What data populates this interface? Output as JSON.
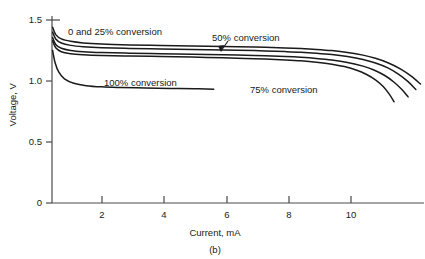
{
  "chart_data": {
    "type": "line",
    "title": "",
    "caption": "(b)",
    "xlabel": "Current, mA",
    "ylabel": "Voltage, V",
    "xlim": [
      0,
      12
    ],
    "ylim": [
      0,
      1.5
    ],
    "xticks": [
      2,
      4,
      6,
      8,
      10
    ],
    "yticks": [
      0,
      0.5,
      1.0,
      1.5
    ],
    "xtick_labels": [
      "2",
      "4",
      "6",
      "8",
      "10"
    ],
    "ytick_labels": [
      "0",
      "0.5",
      "1.0",
      "1.5"
    ],
    "grid": false,
    "legend_position": "inline-annotations",
    "series": [
      {
        "name": "0% conversion",
        "label": "0 and 25% conversion",
        "points": [
          [
            0.02,
            1.44
          ],
          [
            0.12,
            1.38
          ],
          [
            0.3,
            1.345
          ],
          [
            0.6,
            1.325
          ],
          [
            1.0,
            1.312
          ],
          [
            1.6,
            1.303
          ],
          [
            2.5,
            1.296
          ],
          [
            3.5,
            1.291
          ],
          [
            4.5,
            1.287
          ],
          [
            5.5,
            1.283
          ],
          [
            6.5,
            1.278
          ],
          [
            7.5,
            1.271
          ],
          [
            8.0,
            1.266
          ],
          [
            8.5,
            1.259
          ],
          [
            9.0,
            1.249
          ],
          [
            9.5,
            1.234
          ],
          [
            10.0,
            1.212
          ],
          [
            10.4,
            1.186
          ],
          [
            10.8,
            1.15
          ],
          [
            11.2,
            1.1
          ],
          [
            11.55,
            1.04
          ],
          [
            11.85,
            0.975
          ]
        ]
      },
      {
        "name": "25% conversion",
        "label": "",
        "points": [
          [
            0.02,
            1.4
          ],
          [
            0.12,
            1.345
          ],
          [
            0.3,
            1.312
          ],
          [
            0.6,
            1.292
          ],
          [
            1.0,
            1.281
          ],
          [
            1.6,
            1.273
          ],
          [
            2.5,
            1.267
          ],
          [
            3.5,
            1.262
          ],
          [
            4.5,
            1.258
          ],
          [
            5.5,
            1.254
          ],
          [
            6.5,
            1.249
          ],
          [
            7.5,
            1.241
          ],
          [
            8.0,
            1.236
          ],
          [
            8.5,
            1.228
          ],
          [
            9.0,
            1.217
          ],
          [
            9.5,
            1.2
          ],
          [
            10.0,
            1.176
          ],
          [
            10.4,
            1.148
          ],
          [
            10.8,
            1.108
          ],
          [
            11.15,
            1.055
          ],
          [
            11.45,
            0.995
          ],
          [
            11.7,
            0.93
          ]
        ]
      },
      {
        "name": "50% conversion",
        "label": "50% conversion",
        "points": [
          [
            0.02,
            1.355
          ],
          [
            0.12,
            1.3
          ],
          [
            0.3,
            1.268
          ],
          [
            0.6,
            1.25
          ],
          [
            1.0,
            1.24
          ],
          [
            1.6,
            1.233
          ],
          [
            2.5,
            1.228
          ],
          [
            3.5,
            1.224
          ],
          [
            4.5,
            1.22
          ],
          [
            5.5,
            1.215
          ],
          [
            6.5,
            1.209
          ],
          [
            7.5,
            1.2
          ],
          [
            8.0,
            1.194
          ],
          [
            8.5,
            1.185
          ],
          [
            9.0,
            1.172
          ],
          [
            9.5,
            1.152
          ],
          [
            10.0,
            1.122
          ],
          [
            10.35,
            1.09
          ],
          [
            10.7,
            1.045
          ],
          [
            11.0,
            0.99
          ],
          [
            11.25,
            0.93
          ],
          [
            11.45,
            0.87
          ]
        ]
      },
      {
        "name": "75% conversion",
        "label": "75% conversion",
        "points": [
          [
            0.02,
            1.33
          ],
          [
            0.12,
            1.272
          ],
          [
            0.3,
            1.24
          ],
          [
            0.6,
            1.224
          ],
          [
            1.0,
            1.216
          ],
          [
            1.6,
            1.21
          ],
          [
            2.5,
            1.205
          ],
          [
            3.5,
            1.201
          ],
          [
            4.5,
            1.196
          ],
          [
            5.5,
            1.19
          ],
          [
            6.5,
            1.183
          ],
          [
            7.5,
            1.172
          ],
          [
            8.0,
            1.165
          ],
          [
            8.5,
            1.154
          ],
          [
            9.0,
            1.138
          ],
          [
            9.4,
            1.118
          ],
          [
            9.8,
            1.088
          ],
          [
            10.1,
            1.055
          ],
          [
            10.4,
            1.01
          ],
          [
            10.65,
            0.955
          ],
          [
            10.85,
            0.89
          ],
          [
            11.0,
            0.83
          ]
        ]
      },
      {
        "name": "100% conversion",
        "label": "100% conversion",
        "points": [
          [
            0.02,
            1.25
          ],
          [
            0.1,
            1.15
          ],
          [
            0.22,
            1.072
          ],
          [
            0.4,
            1.018
          ],
          [
            0.7,
            0.982
          ],
          [
            1.1,
            0.962
          ],
          [
            1.6,
            0.952
          ],
          [
            2.2,
            0.947
          ],
          [
            3.0,
            0.943
          ],
          [
            3.8,
            0.939
          ],
          [
            4.6,
            0.936
          ],
          [
            5.2,
            0.933
          ]
        ]
      }
    ]
  },
  "annotations": {
    "label_0_25": "0 and 25% conversion",
    "label_50": "50% conversion",
    "label_75": "75% conversion",
    "label_100": "100% conversion"
  },
  "axes": {
    "y_title": "Voltage, V",
    "x_title": "Current, mA",
    "y_labels": {
      "t0": "0",
      "t1": "0.5",
      "t2": "1.0",
      "t3": "1.5"
    },
    "x_labels": {
      "t2": "2",
      "t4": "4",
      "t6": "6",
      "t8": "8",
      "t10": "10"
    }
  },
  "caption": "(b)"
}
